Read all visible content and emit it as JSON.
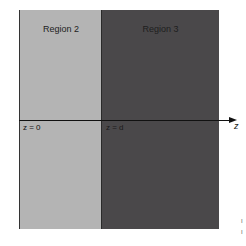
{
  "diagram": {
    "regions": [
      {
        "label": "Region 2",
        "color": "#b4b4b4"
      },
      {
        "label": "Region 3",
        "color": "#4a484a"
      }
    ],
    "axis": {
      "label": "z"
    },
    "boundaries": [
      {
        "label": "z = 0"
      },
      {
        "label": "z = d"
      }
    ],
    "margin_marks": [
      "I",
      "I"
    ]
  }
}
